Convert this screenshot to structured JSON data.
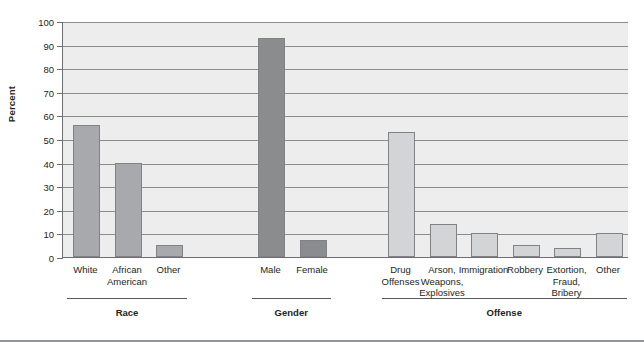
{
  "chart_data": {
    "type": "bar",
    "title": "",
    "xlabel": "",
    "ylabel": "Percent",
    "ylim": [
      0,
      100
    ],
    "yticks": [
      0,
      10,
      20,
      30,
      40,
      50,
      60,
      70,
      80,
      90,
      100
    ],
    "grid": true,
    "legend": "none",
    "groups": [
      {
        "name": "Race",
        "style": "race",
        "categories": [
          "White",
          "African\nAmerican",
          "Other"
        ],
        "values": [
          56,
          40,
          5
        ]
      },
      {
        "name": "Gender",
        "style": "gender",
        "categories": [
          "Male",
          "Female"
        ],
        "values": [
          93,
          7
        ]
      },
      {
        "name": "Offense",
        "style": "offense",
        "categories": [
          "Drug\nOffenses",
          "Arson,\nWeapons,\nExplosives",
          "Immigration",
          "Robbery",
          "Extortion,\nFraud,\nBribery",
          "Other"
        ],
        "values": [
          53,
          14,
          10,
          5,
          4,
          10
        ]
      }
    ]
  },
  "colors": {
    "race_bar": "#a7a9ac",
    "gender_bar": "#8a8c8e",
    "offense_bar": "#d3d4d6",
    "plot_background": "#ededed",
    "axis": "#6d6e71",
    "text": "#231f20"
  }
}
